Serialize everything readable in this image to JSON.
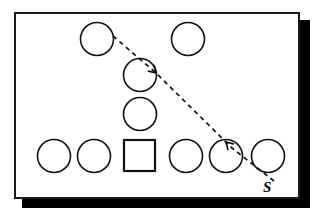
{
  "diagram": {
    "canvas": {
      "width": 318,
      "height": 217
    },
    "panel": {
      "name": "diagram-frame",
      "x": 14,
      "y": 12,
      "width": 286,
      "height": 187,
      "fill": "#ffffff",
      "stroke": "#1a1a1a",
      "stroke_width": 2,
      "shadow": {
        "x": 22,
        "y": 20,
        "width": 288,
        "height": 188,
        "color": "#000000"
      }
    },
    "nodes": [
      {
        "id": "c1",
        "shape": "circle",
        "label": "",
        "cx": 97,
        "cy": 39,
        "r": 16.5,
        "row": "top"
      },
      {
        "id": "c2",
        "shape": "circle",
        "label": "",
        "cx": 188,
        "cy": 39,
        "r": 16.5,
        "row": "top"
      },
      {
        "id": "c3",
        "shape": "circle",
        "label": "",
        "cx": 140,
        "cy": 75,
        "r": 16.5,
        "row": "upper-middle"
      },
      {
        "id": "c4",
        "shape": "circle",
        "label": "",
        "cx": 140,
        "cy": 114,
        "r": 16.5,
        "row": "lower-middle"
      },
      {
        "id": "c5",
        "shape": "circle",
        "label": "",
        "cx": 54,
        "cy": 156,
        "r": 16.5,
        "row": "bottom"
      },
      {
        "id": "c6",
        "shape": "circle",
        "label": "",
        "cx": 94,
        "cy": 156,
        "r": 16.5,
        "row": "bottom"
      },
      {
        "id": "sq1",
        "shape": "square",
        "label": "",
        "x": 124,
        "y": 140,
        "size": 31,
        "row": "bottom"
      },
      {
        "id": "c7",
        "shape": "circle",
        "label": "",
        "cx": 186,
        "cy": 156,
        "r": 16.5,
        "row": "bottom"
      },
      {
        "id": "c8",
        "shape": "circle",
        "label": "",
        "cx": 226,
        "cy": 156,
        "r": 16.5,
        "row": "bottom"
      },
      {
        "id": "c9",
        "shape": "circle",
        "label": "",
        "cx": 268,
        "cy": 156,
        "r": 16.5,
        "row": "bottom"
      }
    ],
    "path": {
      "name": "dashed-motion-path",
      "style": "dashed",
      "stroke": "#111111",
      "from_node": "c1",
      "through_node": "c3",
      "to_node": "c8",
      "points": [
        {
          "x": 113,
          "y": 36
        },
        {
          "x": 156,
          "y": 73
        },
        {
          "x": 232,
          "y": 148
        },
        {
          "x": 274,
          "y": 181
        }
      ],
      "arrowheads": [
        {
          "at": {
            "x": 156,
            "y": 73
          },
          "direction": "down-right",
          "target_node": "c3"
        },
        {
          "at": {
            "x": 226,
            "y": 142
          },
          "direction": "up-left",
          "target_node": "c8"
        }
      ]
    },
    "labels": [
      {
        "id": "s-label",
        "text": "S",
        "x": 263,
        "y": 180,
        "style": "bold-italic",
        "color": "#000000"
      }
    ]
  }
}
